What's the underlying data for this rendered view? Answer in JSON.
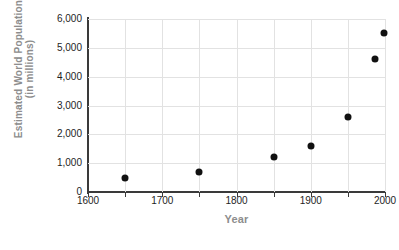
{
  "chart_data": {
    "type": "scatter",
    "title": "",
    "xlabel": "Year",
    "ylabel": "Estimated World Population\n(in millions)",
    "xlim": [
      1600,
      2000
    ],
    "ylim": [
      0,
      6000
    ],
    "xticks": [
      1600,
      1700,
      1800,
      1900,
      2000
    ],
    "xtick_labels": [
      "1600",
      "1700",
      "1800",
      "1900",
      "2000"
    ],
    "xminor_ticks": [
      1650,
      1750,
      1850,
      1950
    ],
    "yticks": [
      0,
      1000,
      2000,
      3000,
      4000,
      5000,
      6000
    ],
    "ytick_labels": [
      "0",
      "1,000",
      "2,000",
      "3,000",
      "4,000",
      "5,000",
      "6,000"
    ],
    "grid": true,
    "legend": false,
    "marker_color": "#111111",
    "grid_color": "#e2e2e2",
    "axis_color": "#3a3a3a",
    "label_color": "#8d8d8d",
    "points": [
      {
        "x": 1650,
        "y": 500
      },
      {
        "x": 1750,
        "y": 700
      },
      {
        "x": 1850,
        "y": 1200
      },
      {
        "x": 1900,
        "y": 1600
      },
      {
        "x": 1950,
        "y": 2600
      },
      {
        "x": 1987,
        "y": 4600
      },
      {
        "x": 1999,
        "y": 5500
      }
    ]
  }
}
